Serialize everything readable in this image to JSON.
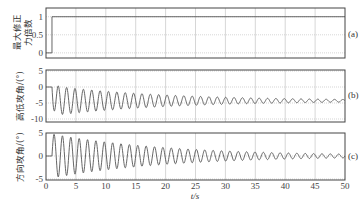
{
  "chart_data": [
    {
      "id": "a",
      "type": "line",
      "panel_label": "(a)",
      "ylabel": "最大修正力倍数",
      "xlabel": "",
      "xlim": [
        0,
        50
      ],
      "ylim": [
        -0.1,
        1.2
      ],
      "yticks": [
        0,
        0.5,
        1
      ],
      "ytick_labels": [
        "0",
        "0.5",
        "1"
      ],
      "grid": true,
      "series": [
        {
          "name": "max correction force multiple",
          "x": [
            0,
            1,
            1,
            50
          ],
          "y": [
            0,
            0,
            1,
            1
          ]
        }
      ]
    },
    {
      "id": "b",
      "type": "line",
      "panel_label": "(b)",
      "ylabel": "高低攻角/(°)",
      "xlabel": "",
      "xlim": [
        0,
        50
      ],
      "ylim": [
        -10,
        5
      ],
      "yticks": [
        -10,
        -5,
        0,
        5
      ],
      "ytick_labels": [
        "-10",
        "-5",
        "0",
        "5"
      ],
      "grid": true,
      "series": [
        {
          "name": "pitch angle of attack",
          "description": "damped oscillation starting at 0 at t=1s, first trough ~-9, converging to ~-4 with period ~1.4s",
          "start_t": 1,
          "initial_value": 0,
          "mean_value": -4.3,
          "initial_amplitude": 4.7,
          "final_amplitude": 0.4,
          "period_s": 1.4
        }
      ]
    },
    {
      "id": "c",
      "type": "line",
      "panel_label": "(c)",
      "ylabel": "方向攻角/(°)",
      "xlabel": "t/s",
      "xlim": [
        0,
        50
      ],
      "ylim": [
        -5,
        5
      ],
      "yticks": [
        -5,
        0,
        5
      ],
      "ytick_labels": [
        "-5",
        "0",
        "5"
      ],
      "xticks": [
        0,
        5,
        10,
        15,
        20,
        25,
        30,
        35,
        40,
        45,
        50
      ],
      "xtick_labels": [
        "0",
        "5",
        "10",
        "15",
        "20",
        "25",
        "30",
        "35",
        "40",
        "45",
        "50"
      ],
      "grid": true,
      "series": [
        {
          "name": "yaw angle of attack",
          "description": "damped oscillation starting at 0 at t=1s, first peak ~4.8, decaying around 0 with period ~1.4s",
          "start_t": 1,
          "initial_value": 0,
          "mean_value": 0,
          "initial_amplitude": 4.8,
          "final_amplitude": 0.4,
          "period_s": 1.4
        }
      ]
    }
  ],
  "labels": {
    "panel_a": "(a)",
    "panel_b": "(b)",
    "panel_c": "(c)",
    "ylabel_a_line1": "最大修正",
    "ylabel_a_line2": "力倍数",
    "ylabel_b": "高低攻角/(°)",
    "ylabel_c": "方向攻角/(°)",
    "xlabel": "t/s"
  },
  "colors": {
    "line": "#555555",
    "axes": "#444444",
    "grid": "#bbbbbb"
  }
}
